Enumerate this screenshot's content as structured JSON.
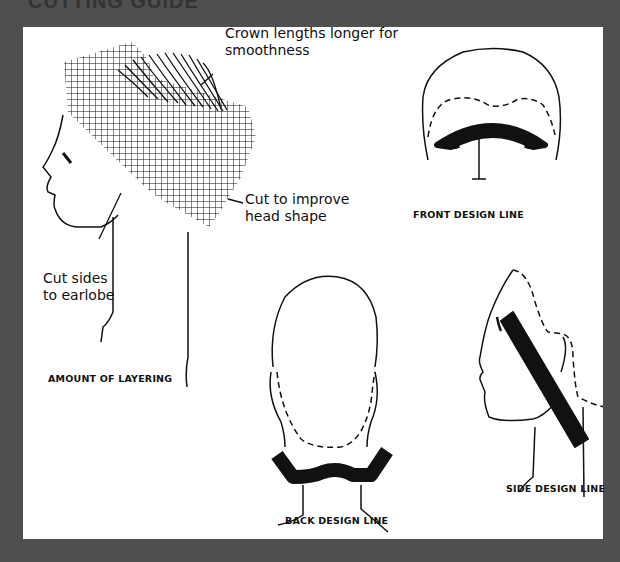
{
  "page": {
    "heading": "CUTTING GUIDE",
    "background_color": "#4f4f4f",
    "panel_color": "#ffffff",
    "ink_color": "#111111"
  },
  "figures": {
    "layering": {
      "caption": "AMOUNT OF LAYERING",
      "annotations": {
        "crown_line1": "Crown lengths longer for",
        "crown_line2": "smoothness",
        "head_line1": "Cut to improve",
        "head_line2": "head shape",
        "sides_line1": "Cut sides",
        "sides_line2": "to earlobe"
      }
    },
    "front": {
      "caption": "FRONT DESIGN LINE"
    },
    "back": {
      "caption": "BACK DESIGN LINE"
    },
    "side": {
      "caption": "SIDE DESIGN LINE"
    }
  }
}
